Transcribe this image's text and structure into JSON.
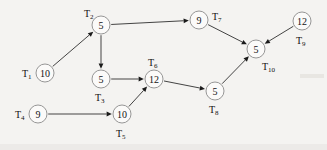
{
  "diagram": {
    "type": "directed-graph",
    "background_color": "#f4f3f1",
    "node_fill": "#fbfaf9",
    "node_stroke": "#8b8b8b",
    "edge_color": "#232323",
    "nodes": [
      {
        "id": "T1",
        "label": "T",
        "sub": "1",
        "value": "10",
        "cx": 45,
        "cy": 73,
        "r": 9,
        "label_x": 22,
        "label_y": 73,
        "label_anchor": "start"
      },
      {
        "id": "T2",
        "label": "T",
        "sub": "2",
        "value": "5",
        "cx": 101,
        "cy": 25,
        "r": 9,
        "label_x": 84,
        "label_y": 13,
        "label_anchor": "start"
      },
      {
        "id": "T3",
        "label": "T",
        "sub": "3",
        "value": "5",
        "cx": 101,
        "cy": 79,
        "r": 9,
        "label_x": 95,
        "label_y": 97,
        "label_anchor": "start"
      },
      {
        "id": "T4",
        "label": "T",
        "sub": "4",
        "value": "9",
        "cx": 38,
        "cy": 114,
        "r": 9,
        "label_x": 15,
        "label_y": 114,
        "label_anchor": "start"
      },
      {
        "id": "T5",
        "label": "T",
        "sub": "5",
        "value": "10",
        "cx": 122,
        "cy": 114,
        "r": 9,
        "label_x": 116,
        "label_y": 133,
        "label_anchor": "start"
      },
      {
        "id": "T6",
        "label": "T",
        "sub": "6",
        "value": "12",
        "cx": 154,
        "cy": 79,
        "r": 9,
        "label_x": 148,
        "label_y": 62,
        "label_anchor": "start"
      },
      {
        "id": "T7",
        "label": "T",
        "sub": "7",
        "value": "9",
        "cx": 199,
        "cy": 20,
        "r": 9,
        "label_x": 212,
        "label_y": 16,
        "label_anchor": "start"
      },
      {
        "id": "T8",
        "label": "T",
        "sub": "8",
        "value": "5",
        "cx": 215,
        "cy": 91,
        "r": 9,
        "label_x": 209,
        "label_y": 109,
        "label_anchor": "start"
      },
      {
        "id": "T9",
        "label": "T",
        "sub": "9",
        "value": "12",
        "cx": 302,
        "cy": 21,
        "r": 9,
        "label_x": 296,
        "label_y": 40,
        "label_anchor": "start"
      },
      {
        "id": "T10",
        "label": "T",
        "sub": "10",
        "value": "5",
        "cx": 256,
        "cy": 49,
        "r": 9,
        "label_x": 262,
        "label_y": 66,
        "label_anchor": "start"
      }
    ],
    "edges": [
      {
        "from": "T1",
        "to": "T2"
      },
      {
        "from": "T2",
        "to": "T3"
      },
      {
        "from": "T2",
        "to": "T7"
      },
      {
        "from": "T3",
        "to": "T6"
      },
      {
        "from": "T4",
        "to": "T5"
      },
      {
        "from": "T5",
        "to": "T6"
      },
      {
        "from": "T6",
        "to": "T8"
      },
      {
        "from": "T7",
        "to": "T10"
      },
      {
        "from": "T8",
        "to": "T10"
      },
      {
        "from": "T9",
        "to": "T10"
      }
    ]
  }
}
